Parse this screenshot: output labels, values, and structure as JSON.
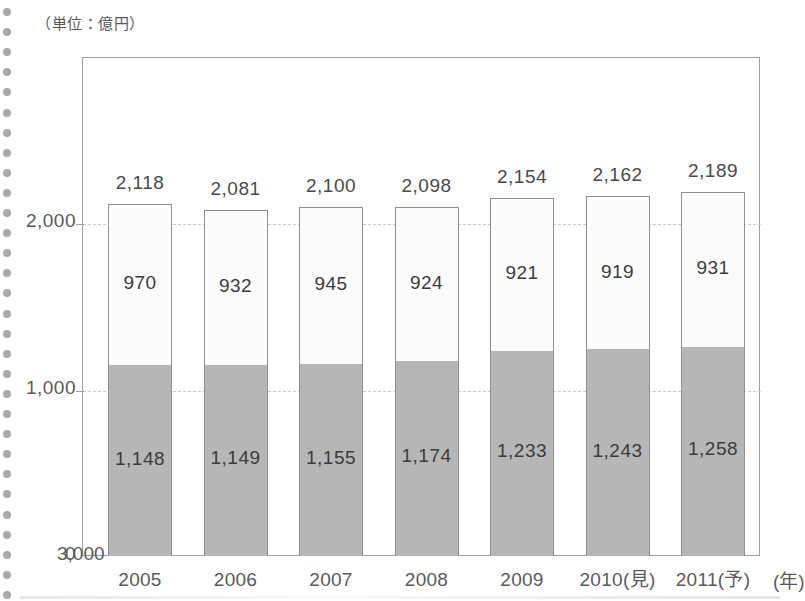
{
  "unit_caption": "（単位：億円）",
  "x_axis_unit": "(年)",
  "y_ticks": [
    "3,000",
    "2,000",
    "1,000",
    "0"
  ],
  "chart_data": {
    "type": "bar",
    "title": "",
    "subtitle": "",
    "xlabel": "(年)",
    "ylabel": "（単位：億円）",
    "ylim": [
      0,
      3000
    ],
    "y_ticks": [
      0,
      1000,
      2000,
      3000
    ],
    "y_tick_labels": [
      "0",
      "1,000",
      "2,000",
      "3,000"
    ],
    "grid": true,
    "grid_style": "dashed-horizontal",
    "legend": "none",
    "stacked": true,
    "categories": [
      "2005",
      "2006",
      "2007",
      "2008",
      "2009",
      "2010(見)",
      "2011(予)"
    ],
    "series": [
      {
        "name": "lower",
        "color": "#b6b6b6",
        "values": [
          1148,
          1149,
          1155,
          1174,
          1233,
          1243,
          1258
        ],
        "labels": [
          "1,148",
          "1,149",
          "1,155",
          "1,174",
          "1,233",
          "1,243",
          "1,258"
        ]
      },
      {
        "name": "upper",
        "color": "#fcfcfc",
        "values": [
          970,
          932,
          945,
          924,
          921,
          919,
          931
        ],
        "labels": [
          "970",
          "932",
          "945",
          "924",
          "921",
          "919",
          "931"
        ]
      }
    ],
    "totals": [
      2118,
      2081,
      2100,
      2098,
      2154,
      2162,
      2189
    ],
    "total_labels": [
      "2,118",
      "2,081",
      "2,100",
      "2,098",
      "2,154",
      "2,162",
      "2,189"
    ]
  }
}
